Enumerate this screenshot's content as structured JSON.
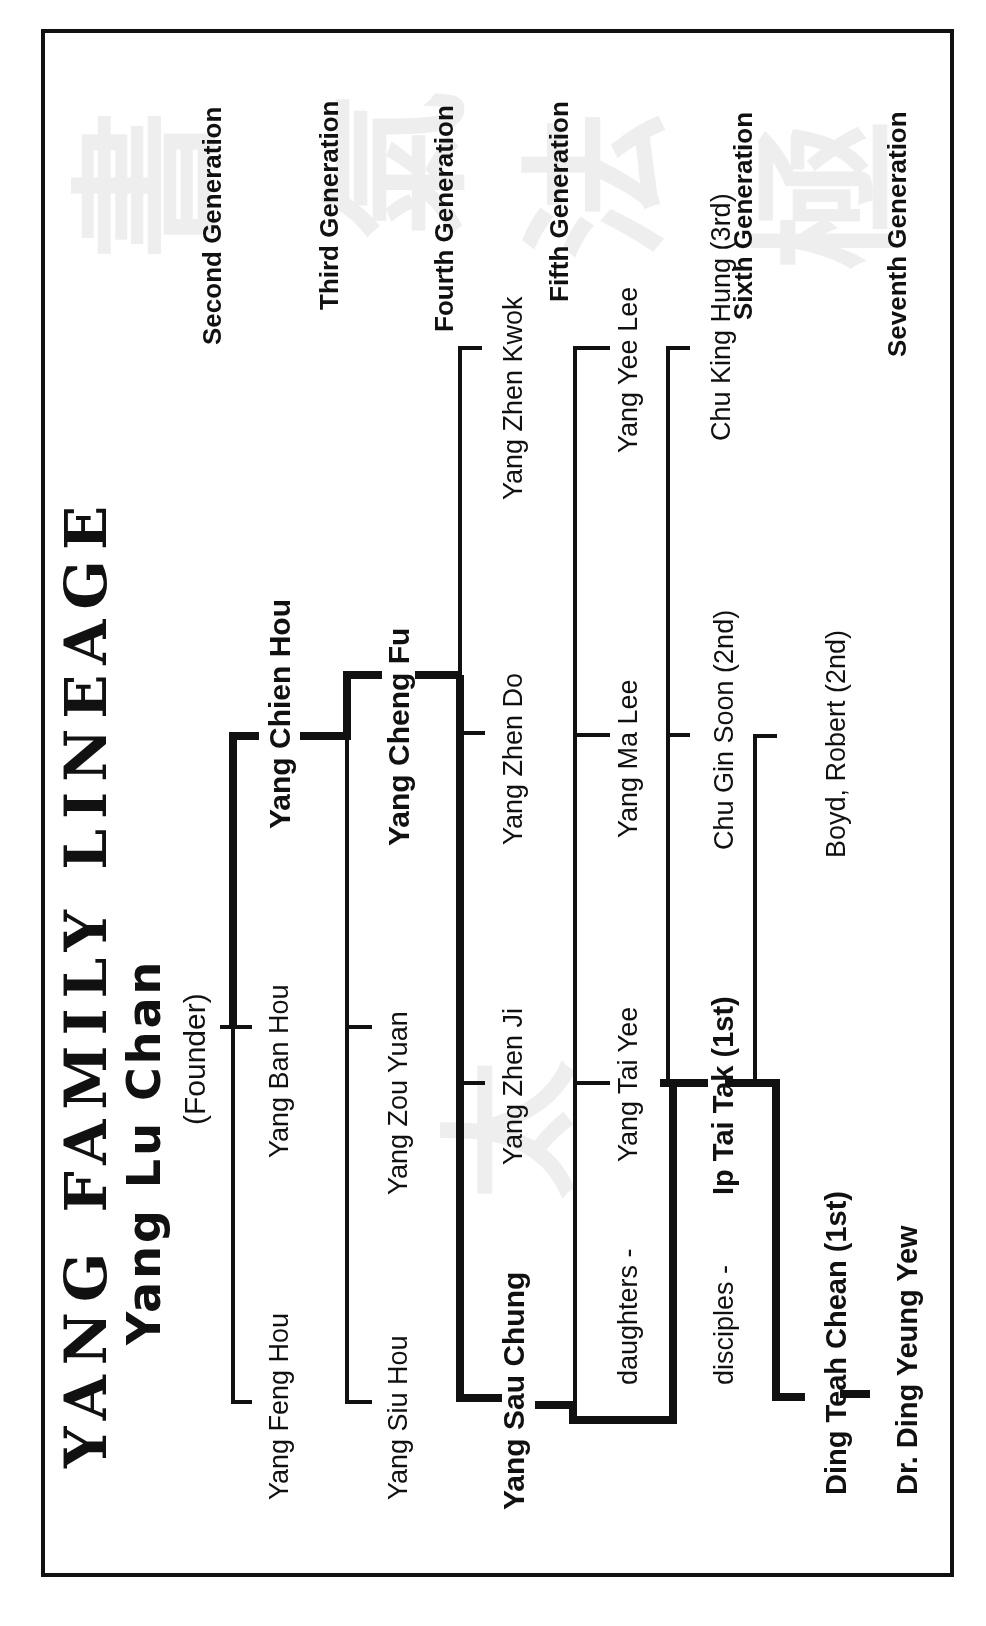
{
  "title": "YANG FAMILY LINEAGE",
  "founder": {
    "name": "Yang Lu Chan",
    "note": "(Founder)"
  },
  "generations": [
    {
      "label": "Second Generation",
      "members": [
        "Yang Feng Hou",
        "Yang Ban Hou",
        "Yang Chien Hou"
      ],
      "highlight": "Yang Chien Hou"
    },
    {
      "label": "Third Generation",
      "members": [
        "Yang Siu Hou",
        "Yang Zou Yuan",
        "Yang Cheng Fu"
      ],
      "highlight": "Yang Cheng Fu"
    },
    {
      "label": "Fourth Generation",
      "members": [
        "Yang Sau Chung",
        "Yang Zhen Ji",
        "Yang Zhen Do",
        "Yang Zhen Kwok"
      ],
      "highlight": "Yang Sau Chung"
    },
    {
      "label": "Fifth Generation",
      "prefix": "daughters -",
      "members": [
        "Yang Tai Yee",
        "Yang Ma Lee",
        "Yang Yee Lee"
      ]
    },
    {
      "label": "Sixth Generation",
      "prefix": "disciples -",
      "members": [
        "Ip Tai Tak (1st)",
        "Chu Gin Soon (2nd)",
        "Chu King Hung (3rd)"
      ],
      "highlight": "Ip Tai Tak (1st)"
    },
    {
      "label": "Seventh Generation",
      "members": [
        "Ding Teah Chean (1st)",
        "Boyd, Robert (2nd)"
      ],
      "highlight": "Ding Teah Chean (1st)"
    }
  ],
  "successor": "Dr. Ding Yeung Yew",
  "labels": {
    "gen2": "Second Generation",
    "gen3": "Third Generation",
    "gen4": "Fourth Generation",
    "gen5": "Fifth Generation",
    "gen6": "Sixth Generation",
    "gen7": "Seventh Generation",
    "g2_1": "Yang Feng Hou",
    "g2_2": "Yang Ban Hou",
    "g2_3": "Yang Chien Hou",
    "g3_1": "Yang Siu Hou",
    "g3_2": "Yang Zou Yuan",
    "g3_3": "Yang Cheng Fu",
    "g4_1": "Yang Sau Chung",
    "g4_2": "Yang Zhen Ji",
    "g4_3": "Yang Zhen Do",
    "g4_4": "Yang Zhen Kwok",
    "g5_prefix": "daughters -",
    "g5_1": "Yang Tai Yee",
    "g5_2": "Yang Ma Lee",
    "g5_3": "Yang Yee Lee",
    "g6_prefix": "disciples -",
    "g6_1": "Ip Tai Tak (1st)",
    "g6_2": "Chu Gin Soon (2nd)",
    "g6_3": "Chu King Hung (3rd)",
    "g7_1": "Ding Teah Chean (1st)",
    "g7_2": "Boyd, Robert (2nd)",
    "g8_1": "Dr. Ding Yeung Yew"
  },
  "colors": {
    "ink": "#111111",
    "background": "#ffffff",
    "watermark": "#ececec"
  }
}
